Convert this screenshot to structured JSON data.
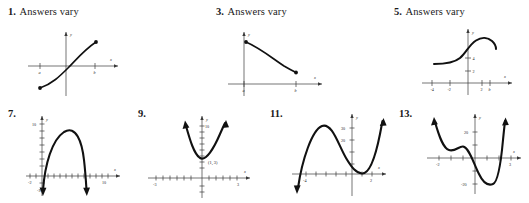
{
  "page": {
    "kind": "textbook-answer-key",
    "background_color": "#ffffff",
    "ink_color": "#111111",
    "axis_color": "#3a3a3a"
  },
  "row1": [
    {
      "number": "1.",
      "answer": "Answers vary",
      "graph": {
        "id": "graph-1",
        "description": "increasing curve from point a to point b",
        "x_labels": [
          "a",
          "b"
        ],
        "y_labels": [],
        "axis_labels": {
          "x": "x",
          "y": "y"
        },
        "endpoints": [
          "a",
          "b"
        ]
      }
    },
    {
      "number": "3.",
      "answer": "Answers vary",
      "graph": {
        "id": "graph-3",
        "description": "decreasing curve from a to b above the x-axis",
        "x_labels": [
          "a",
          "b"
        ],
        "y_labels": [],
        "axis_labels": {
          "x": "x",
          "y": "y"
        },
        "endpoints": [
          "a",
          "b"
        ]
      }
    },
    {
      "number": "5.",
      "answer": "Answers vary",
      "graph": {
        "id": "graph-5",
        "description": "S-shaped curve rising then peaking near b",
        "x_labels": [
          "-4",
          "-2",
          "2",
          "b"
        ],
        "y_labels": [
          "2",
          "4"
        ],
        "axis_labels": {
          "x": "x",
          "y": "y"
        },
        "endpoints": []
      }
    }
  ],
  "row2": [
    {
      "number": "7.",
      "answer": "",
      "graph": {
        "id": "graph-7",
        "description": "downward parabola with arrowheads at both ends",
        "x_labels": [
          "-2",
          "10"
        ],
        "y_labels": [
          "10",
          "-3"
        ],
        "axis_labels": {
          "x": "x",
          "y": "y"
        },
        "point_label": ""
      }
    },
    {
      "number": "9.",
      "answer": "",
      "graph": {
        "id": "graph-9",
        "description": "upward parabola with vertex labeled",
        "x_labels": [
          "-3",
          "3"
        ],
        "y_labels": [
          "10"
        ],
        "axis_labels": {
          "x": "x",
          "y": "y"
        },
        "point_label": "(1, 3)"
      }
    },
    {
      "number": "11.",
      "answer": "",
      "graph": {
        "id": "graph-11",
        "description": "cubic curve with local max and local min",
        "x_labels": [
          "-4",
          "2"
        ],
        "y_labels": [
          "20",
          "30"
        ],
        "axis_labels": {
          "x": "x",
          "y": "y"
        },
        "point_label": ""
      }
    },
    {
      "number": "13.",
      "answer": "",
      "graph": {
        "id": "graph-13",
        "description": "quartic curve with two local minima and a local max",
        "x_labels": [
          "-2",
          "3"
        ],
        "y_labels": [
          "20",
          "-20"
        ],
        "axis_labels": {
          "x": "x",
          "y": "y"
        },
        "point_label": ""
      }
    }
  ]
}
